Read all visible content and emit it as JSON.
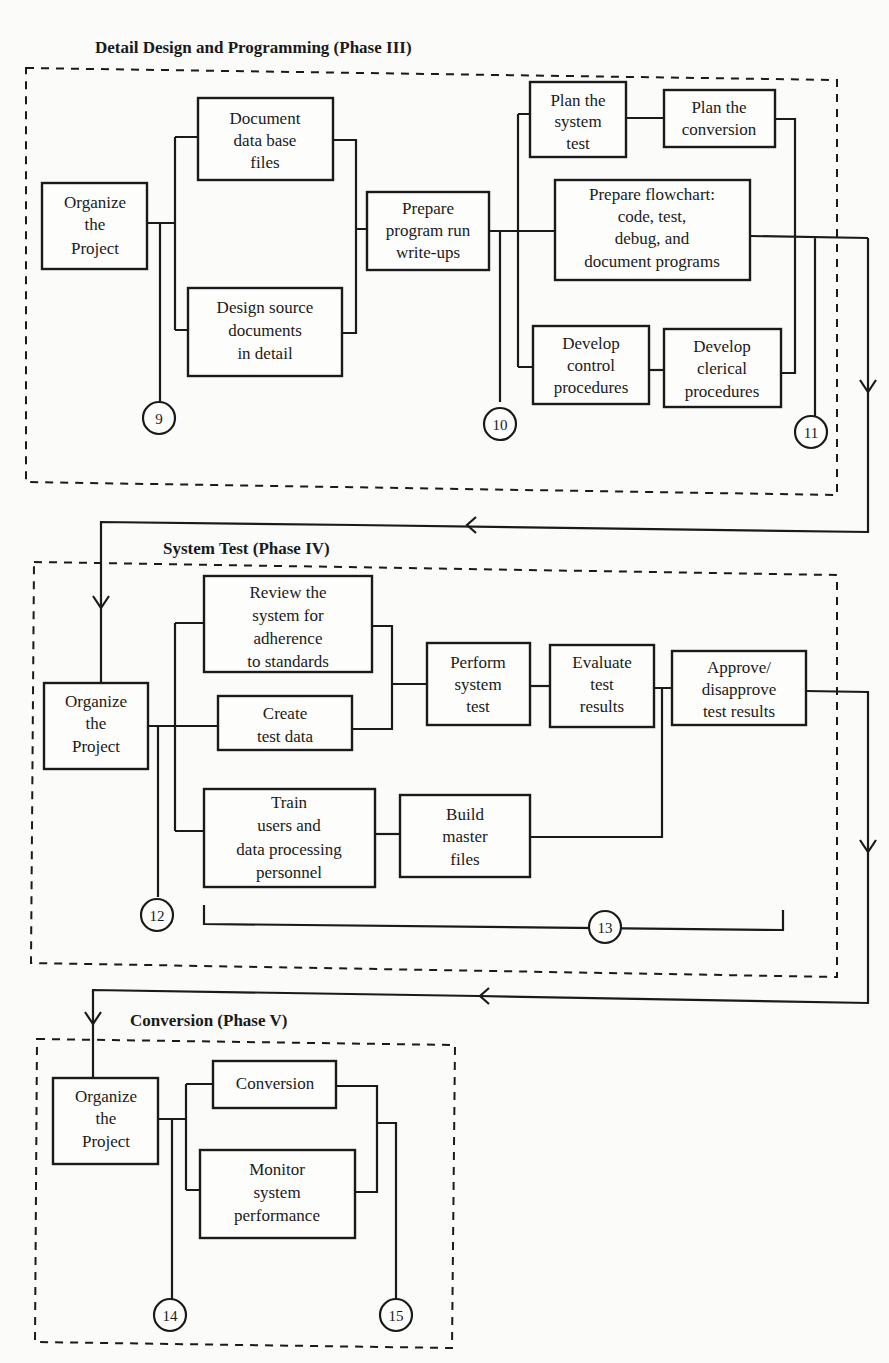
{
  "phase3": {
    "title": "Detail Design and Programming (Phase III)",
    "organize": [
      "Organize",
      "the",
      "Project"
    ],
    "document_db": [
      "Document",
      "data base",
      "files"
    ],
    "design_source": [
      "Design source",
      "documents",
      "in detail"
    ],
    "prepare_runs": [
      "Prepare",
      "program run",
      "write-ups"
    ],
    "plan_system_test": [
      "Plan the",
      "system",
      "test"
    ],
    "plan_conversion": [
      "Plan the",
      "conversion"
    ],
    "prepare_flowchart": [
      "Prepare flowchart:",
      "code, test,",
      "debug, and",
      "document programs"
    ],
    "develop_control": [
      "Develop",
      "control",
      "procedures"
    ],
    "develop_clerical": [
      "Develop",
      "clerical",
      "procedures"
    ],
    "milestones": [
      "9",
      "10",
      "11"
    ]
  },
  "phase4": {
    "title": "System Test (Phase IV)",
    "organize": [
      "Organize",
      "the",
      "Project"
    ],
    "review": [
      "Review the",
      "system for",
      "adherence",
      "to standards"
    ],
    "create_test_data": [
      "Create",
      "test data"
    ],
    "train": [
      "Train",
      "users and",
      "data processing",
      "personnel"
    ],
    "build_master": [
      "Build",
      "master",
      "files"
    ],
    "perform_test": [
      "Perform",
      "system",
      "test"
    ],
    "evaluate": [
      "Evaluate",
      "test",
      "results"
    ],
    "approve": [
      "Approve/",
      "disapprove",
      "test results"
    ],
    "milestones": [
      "12",
      "13"
    ]
  },
  "phase5": {
    "title": "Conversion (Phase V)",
    "organize": [
      "Organize",
      "the",
      "Project"
    ],
    "conversion": [
      "Conversion"
    ],
    "monitor": [
      "Monitor",
      "system",
      "performance"
    ],
    "milestones": [
      "14",
      "15"
    ]
  }
}
